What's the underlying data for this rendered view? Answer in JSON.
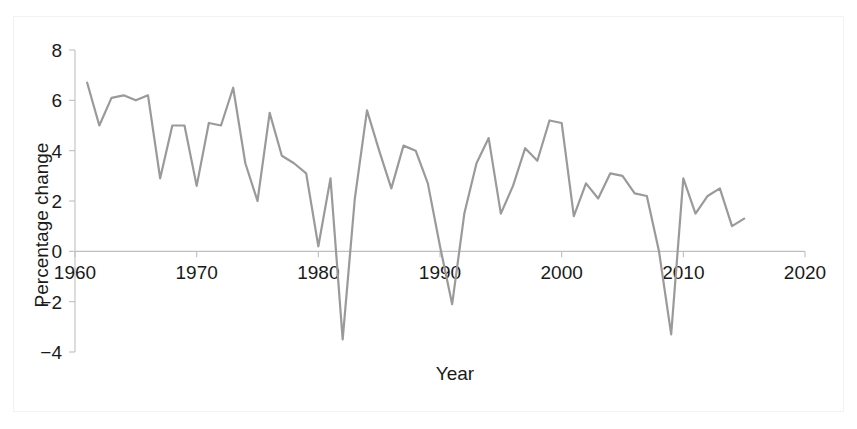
{
  "chart_data": {
    "type": "line",
    "title": "",
    "subtitle": "",
    "xlabel": "Year",
    "ylabel": "Percentage change",
    "xlim": [
      1960,
      2020
    ],
    "ylim": [
      -4,
      8
    ],
    "xticks": [
      1960,
      1970,
      1980,
      1990,
      2000,
      2010,
      2020
    ],
    "xtick_labels": [
      "1960",
      "1970",
      "1980",
      "1990",
      "2000",
      "2010",
      "2020"
    ],
    "yticks": [
      -4,
      -2,
      0,
      2,
      4,
      6,
      8
    ],
    "ytick_labels": [
      "−4",
      "−2",
      "0",
      "2",
      "4",
      "6",
      "8"
    ],
    "grid": false,
    "legend": "none",
    "line_color": "#9a9a9a",
    "axis_color": "#bfbfbf",
    "text_color": "#1a1a1a",
    "background_color": "#ffffff",
    "series": [
      {
        "name": "Percentage change",
        "x": [
          1961,
          1962,
          1963,
          1964,
          1965,
          1966,
          1967,
          1968,
          1969,
          1970,
          1971,
          1972,
          1973,
          1974,
          1975,
          1976,
          1977,
          1978,
          1979,
          1980,
          1981,
          1982,
          1983,
          1984,
          1985,
          1986,
          1987,
          1988,
          1989,
          1990,
          1991,
          1992,
          1993,
          1994,
          1995,
          1996,
          1997,
          1998,
          1999,
          2000,
          2001,
          2002,
          2003,
          2004,
          2005,
          2006,
          2007,
          2008,
          2009,
          2010,
          2011,
          2012,
          2013,
          2014,
          2015
        ],
        "values": [
          6.7,
          5.0,
          6.1,
          6.2,
          6.0,
          6.2,
          2.9,
          5.0,
          5.0,
          2.6,
          5.1,
          5.0,
          6.5,
          3.5,
          2.0,
          5.5,
          3.8,
          3.5,
          3.1,
          0.2,
          2.9,
          -3.5,
          2.1,
          5.6,
          4.0,
          2.5,
          4.2,
          4.0,
          2.7,
          0.2,
          -2.1,
          1.5,
          3.5,
          4.5,
          1.5,
          2.6,
          4.1,
          3.6,
          5.2,
          5.1,
          1.4,
          2.7,
          2.1,
          3.1,
          3.0,
          2.3,
          2.2,
          0.0,
          -3.3,
          2.9,
          1.5,
          2.2,
          2.5,
          1.0,
          1.3
        ]
      }
    ]
  }
}
